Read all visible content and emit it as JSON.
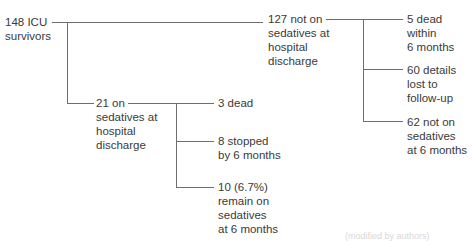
{
  "diagram": {
    "type": "flowchart-tree",
    "nodes": {
      "root": {
        "label": "148 ICU\nsurvivors"
      },
      "not_on": {
        "label": "127 not on\nsedatives at\nhospital\ndischarge"
      },
      "on": {
        "label": "21 on\nsedatives at\nhospital\ndischarge"
      },
      "not_on_dead": {
        "label": "5 dead\nwithin\n6 months"
      },
      "not_on_lost": {
        "label": "60 details\nlost to\nfollow-up"
      },
      "not_on_still": {
        "label": "62 not on\nsedatives\nat 6 months"
      },
      "on_dead": {
        "label": "3 dead"
      },
      "on_stopped": {
        "label": "8 stopped\nby 6 months"
      },
      "on_remain": {
        "label": "10 (6.7%)\nremain on\nsedatives\nat 6 months"
      }
    },
    "edges": [
      [
        "root",
        "not_on"
      ],
      [
        "root",
        "on"
      ],
      [
        "not_on",
        "not_on_dead"
      ],
      [
        "not_on",
        "not_on_lost"
      ],
      [
        "not_on",
        "not_on_still"
      ],
      [
        "on",
        "on_dead"
      ],
      [
        "on",
        "on_stopped"
      ],
      [
        "on",
        "on_remain"
      ]
    ],
    "footer_fragment": "(modified by authors)"
  }
}
